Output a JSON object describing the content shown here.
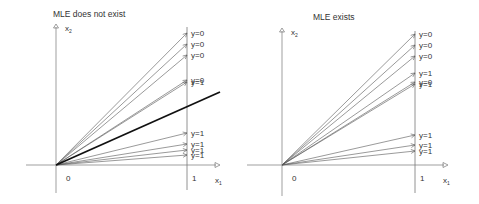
{
  "panels": [
    {
      "title": "MLE does not exist",
      "origin_label": "0",
      "x1_tick_label": "1",
      "x_axis_label": "x",
      "x_axis_sub": "1",
      "y_axis_label": "x",
      "y_axis_sub": "2",
      "vectors": [
        {
          "end_y": 33,
          "label": "y=0"
        },
        {
          "end_y": 44,
          "label": "y=0"
        },
        {
          "end_y": 55,
          "label": "y=0"
        },
        {
          "end_y": 80,
          "label": "y=0"
        },
        {
          "end_y": 82,
          "label": "y=1"
        },
        {
          "end_y": 133,
          "label": "y=1"
        },
        {
          "end_y": 144,
          "label": "y=1"
        },
        {
          "end_y": 150,
          "label": "y=1"
        },
        {
          "end_y": 155,
          "label": "y=1"
        }
      ],
      "separator": {
        "present": true
      }
    },
    {
      "title": "MLE exists",
      "origin_label": "0",
      "x1_tick_label": "1",
      "x_axis_label": "x",
      "x_axis_sub": "1",
      "y_axis_label": "x",
      "y_axis_sub": "2",
      "vectors": [
        {
          "end_y": 34,
          "label": "y=0"
        },
        {
          "end_y": 45,
          "label": "y=0"
        },
        {
          "end_y": 56,
          "label": "y=0"
        },
        {
          "end_y": 73,
          "label": "y=1"
        },
        {
          "end_y": 82,
          "label": "y=0"
        },
        {
          "end_y": 84,
          "label": "y=1"
        },
        {
          "end_y": 135,
          "label": "y=1"
        },
        {
          "end_y": 145,
          "label": "y=1"
        },
        {
          "end_y": 151,
          "label": "y=1"
        }
      ],
      "separator": {
        "present": false
      }
    }
  ],
  "colors": {
    "axis": "#777777",
    "vector": "#555555",
    "separator": "#111111",
    "text": "#333333"
  }
}
